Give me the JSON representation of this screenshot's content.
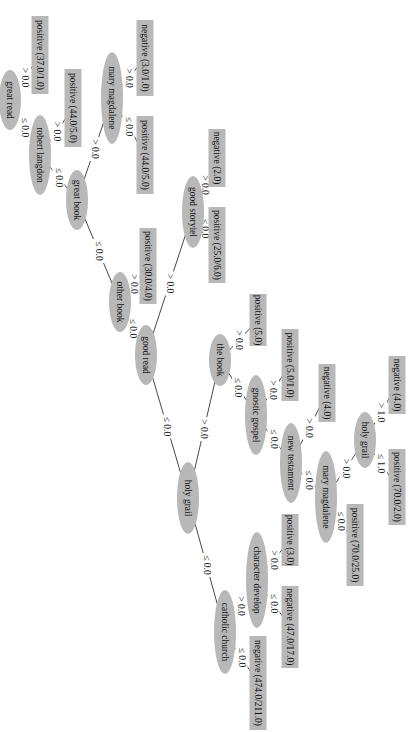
{
  "diagram": {
    "type": "decision-tree",
    "orientation": "rotated-90-clockwise",
    "colors": {
      "node_fill": "#b8b8b8",
      "edge": "#333333",
      "text": "#111111",
      "background": "#ffffff"
    },
    "nodes": [
      {
        "id": "n_holy_grail_root",
        "kind": "split",
        "label": "holy grail",
        "x": 188,
        "y": 498,
        "rx": 36,
        "ry": 11
      },
      {
        "id": "n_good_read",
        "kind": "split",
        "label": "good read",
        "x": 146,
        "y": 355,
        "rx": 30,
        "ry": 11
      },
      {
        "id": "n_other_book",
        "kind": "split",
        "label": "other book",
        "x": 120,
        "y": 302,
        "rx": 30,
        "ry": 11
      },
      {
        "id": "n_great_book",
        "kind": "split",
        "label": "great book",
        "x": 77,
        "y": 200,
        "rx": 30,
        "ry": 11
      },
      {
        "id": "n_robert_langdon",
        "kind": "split",
        "label": "robert langdon",
        "x": 40,
        "y": 155,
        "rx": 40,
        "ry": 11
      },
      {
        "id": "n_great_read",
        "kind": "split",
        "label": "great read",
        "x": 10,
        "y": 100,
        "rx": 30,
        "ry": 11
      },
      {
        "id": "n_mary_magdalene_1",
        "kind": "split",
        "label": "mary magdalene",
        "x": 112,
        "y": 98,
        "rx": 46,
        "ry": 11
      },
      {
        "id": "n_good_storyiel",
        "kind": "split",
        "label": "good storyiel",
        "x": 193,
        "y": 212,
        "rx": 36,
        "ry": 11
      },
      {
        "id": "n_the_book",
        "kind": "split",
        "label": "the book",
        "x": 220,
        "y": 360,
        "rx": 26,
        "ry": 11
      },
      {
        "id": "n_gnostic_gospel",
        "kind": "split",
        "label": "gnostic gospel",
        "x": 256,
        "y": 415,
        "rx": 40,
        "ry": 11
      },
      {
        "id": "n_new_testament",
        "kind": "split",
        "label": "new testament",
        "x": 291,
        "y": 463,
        "rx": 40,
        "ry": 11
      },
      {
        "id": "n_mary_magdalene_2",
        "kind": "split",
        "label": "mary magdalene",
        "x": 326,
        "y": 497,
        "rx": 46,
        "ry": 11
      },
      {
        "id": "n_holy_grail_2",
        "kind": "split",
        "label": "holy grail",
        "x": 365,
        "y": 440,
        "rx": 28,
        "ry": 11
      },
      {
        "id": "n_catholic_church",
        "kind": "split",
        "label": "catholic church",
        "x": 225,
        "y": 632,
        "rx": 42,
        "ry": 11
      },
      {
        "id": "n_character_develop",
        "kind": "split",
        "label": "character develop",
        "x": 257,
        "y": 580,
        "rx": 48,
        "ry": 11
      },
      {
        "id": "l_pos_37_1",
        "kind": "leaf",
        "label": "positive (37.0/1.0)",
        "x": 40,
        "y": 55,
        "w": 78,
        "h": 17
      },
      {
        "id": "l_pos_44_5_a",
        "kind": "leaf",
        "label": "positive (44.0/5.0)",
        "x": 73,
        "y": 108,
        "w": 78,
        "h": 17
      },
      {
        "id": "l_neg_3_1",
        "kind": "leaf",
        "label": "negative (3.0/1.0)",
        "x": 145,
        "y": 58,
        "w": 76,
        "h": 17
      },
      {
        "id": "l_pos_44_5_b",
        "kind": "leaf",
        "label": "positive (44.0/5.0)",
        "x": 145,
        "y": 155,
        "w": 78,
        "h": 17
      },
      {
        "id": "l_pos_30_4",
        "kind": "leaf",
        "label": "positive (30.0/4.0)",
        "x": 148,
        "y": 266,
        "w": 76,
        "h": 17
      },
      {
        "id": "l_neg_2",
        "kind": "leaf",
        "label": "negative (2.0)",
        "x": 217,
        "y": 158,
        "w": 58,
        "h": 17
      },
      {
        "id": "l_pos_25_6",
        "kind": "leaf",
        "label": "positive (25.0/6.0)",
        "x": 217,
        "y": 245,
        "w": 76,
        "h": 17
      },
      {
        "id": "l_pos_5",
        "kind": "leaf",
        "label": "positive (5.0)",
        "x": 258,
        "y": 320,
        "w": 52,
        "h": 17
      },
      {
        "id": "l_pos_5_1",
        "kind": "leaf",
        "label": "positive (5.0/1.0)",
        "x": 290,
        "y": 365,
        "w": 72,
        "h": 17
      },
      {
        "id": "l_neg_4_a",
        "kind": "leaf",
        "label": "negative (4.0)",
        "x": 327,
        "y": 393,
        "w": 58,
        "h": 17
      },
      {
        "id": "l_neg_4_b",
        "kind": "leaf",
        "label": "negative (4.0)",
        "x": 397,
        "y": 385,
        "w": 58,
        "h": 17
      },
      {
        "id": "l_pos_70_2",
        "kind": "leaf",
        "label": "positive (70.0/2.0)",
        "x": 397,
        "y": 487,
        "w": 76,
        "h": 17
      },
      {
        "id": "l_pos_70_25",
        "kind": "leaf",
        "label": "positive (70.0/25.0)",
        "x": 355,
        "y": 545,
        "w": 82,
        "h": 17
      },
      {
        "id": "l_pos_3",
        "kind": "leaf",
        "label": "positive (3.0)",
        "x": 290,
        "y": 540,
        "w": 52,
        "h": 17
      },
      {
        "id": "l_neg_47_17",
        "kind": "leaf",
        "label": "negative (47.0/17.0)",
        "x": 290,
        "y": 627,
        "w": 82,
        "h": 17
      },
      {
        "id": "l_neg_474_211",
        "kind": "leaf",
        "label": "negative (474.0/211.0)",
        "x": 258,
        "y": 683,
        "w": 94,
        "h": 17
      }
    ],
    "edges": [
      {
        "from": "n_holy_grail_root",
        "to": "n_good_read",
        "label": "≤ 0.0"
      },
      {
        "from": "n_holy_grail_root",
        "to": "n_the_book",
        "label": "> 0.0"
      },
      {
        "from": "n_holy_grail_root",
        "to": "n_catholic_church",
        "label": "≤ 0.0"
      },
      {
        "from": "n_good_read",
        "to": "n_other_book",
        "label": "≤ 0.0"
      },
      {
        "from": "n_good_read",
        "to": "n_good_storyiel",
        "label": "> 0.0"
      },
      {
        "from": "n_other_book",
        "to": "n_great_book",
        "label": "≤ 0.0"
      },
      {
        "from": "n_other_book",
        "to": "l_pos_30_4",
        "label": "> 0.0"
      },
      {
        "from": "n_great_book",
        "to": "n_robert_langdon",
        "label": "≤ 0.0"
      },
      {
        "from": "n_great_book",
        "to": "n_mary_magdalene_1",
        "label": "> 0.0"
      },
      {
        "from": "n_robert_langdon",
        "to": "n_great_read",
        "label": "≤ 0.0"
      },
      {
        "from": "n_robert_langdon",
        "to": "l_pos_44_5_a",
        "label": "> 0.0"
      },
      {
        "from": "n_great_read",
        "to": "l_pos_37_1",
        "label": "> 0.0"
      },
      {
        "from": "n_mary_magdalene_1",
        "to": "l_neg_3_1",
        "label": "> 0.0"
      },
      {
        "from": "n_mary_magdalene_1",
        "to": "l_pos_44_5_b",
        "label": "≤ 0.0"
      },
      {
        "from": "n_good_storyiel",
        "to": "l_neg_2",
        "label": "> 0.0"
      },
      {
        "from": "n_good_storyiel",
        "to": "l_pos_25_6",
        "label": "≤ 0.0"
      },
      {
        "from": "n_the_book",
        "to": "l_pos_5",
        "label": "> 0.0"
      },
      {
        "from": "n_the_book",
        "to": "n_gnostic_gospel",
        "label": "≤ 0.0"
      },
      {
        "from": "n_gnostic_gospel",
        "to": "l_pos_5_1",
        "label": "> 0.0"
      },
      {
        "from": "n_gnostic_gospel",
        "to": "n_new_testament",
        "label": "≤ 0.0"
      },
      {
        "from": "n_new_testament",
        "to": "l_neg_4_a",
        "label": "> 0.0"
      },
      {
        "from": "n_new_testament",
        "to": "n_mary_magdalene_2",
        "label": "≤ 0.0"
      },
      {
        "from": "n_mary_magdalene_2",
        "to": "n_holy_grail_2",
        "label": "> 0.0"
      },
      {
        "from": "n_mary_magdalene_2",
        "to": "l_pos_70_25",
        "label": "≤ 0.0"
      },
      {
        "from": "n_holy_grail_2",
        "to": "l_neg_4_b",
        "label": "> 1.0"
      },
      {
        "from": "n_holy_grail_2",
        "to": "l_pos_70_2",
        "label": "≤ 1.0"
      },
      {
        "from": "n_catholic_church",
        "to": "n_character_develop",
        "label": "> 0.0"
      },
      {
        "from": "n_catholic_church",
        "to": "l_neg_474_211",
        "label": "≤ 0.0"
      },
      {
        "from": "n_character_develop",
        "to": "l_pos_3",
        "label": "> 0.0"
      },
      {
        "from": "n_character_develop",
        "to": "l_neg_47_17",
        "label": "≤ 0.0"
      }
    ]
  }
}
